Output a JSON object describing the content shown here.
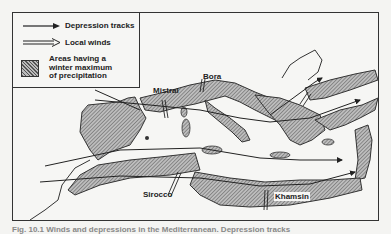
{
  "legend": {
    "depression_tracks": "Depression tracks",
    "local_winds": "Local winds",
    "precip_line1": "Areas having a",
    "precip_line2": "winter maximum",
    "precip_line3": "of precipitation"
  },
  "wind_labels": {
    "mistral": "Mistral",
    "bora": "Bora",
    "sirocco": "Sirocco",
    "khamsin": "Khamsin"
  },
  "caption": "Fig. 10.1 Winds and depressions in the Mediterranean. Depression tracks"
}
